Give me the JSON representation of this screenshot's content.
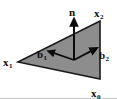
{
  "figure": {
    "kind": "geometry-diagram",
    "width": 117,
    "height": 99,
    "background_color": "#ffffff",
    "frame": {
      "visible": true,
      "color": "#c8c8c8",
      "edges": "bottom"
    }
  },
  "triangle": {
    "name": "triangle-facet",
    "fill_color": "#8d8d8d",
    "stroke_color": "#1a1a1a",
    "stroke_width": 1.6,
    "vertices": [
      {
        "label_key": "x1",
        "x": 18,
        "y": 62
      },
      {
        "label_key": "x2",
        "x": 100,
        "y": 21
      },
      {
        "label_key": "x0",
        "x": 100,
        "y": 79
      }
    ]
  },
  "origin": {
    "x": 74,
    "y": 60
  },
  "vectors": [
    {
      "key": "n",
      "label_base": "n",
      "label_sub": "",
      "color": "#0b0b0b",
      "from": {
        "x": 74,
        "y": 60
      },
      "to": {
        "x": 74,
        "y": 19
      },
      "direction": "up"
    },
    {
      "key": "b1",
      "label_base": "b",
      "label_sub": "1",
      "color": "#0b0b0b",
      "from": {
        "x": 74,
        "y": 60
      },
      "to": {
        "x": 48,
        "y": 51
      },
      "direction": "left"
    },
    {
      "key": "b2",
      "label_base": "b",
      "label_sub": "2",
      "color": "#0b0b0b",
      "from": {
        "x": 74,
        "y": 60
      },
      "to": {
        "x": 97,
        "y": 48
      },
      "direction": "right"
    }
  ],
  "labels": {
    "x1": {
      "base": "x",
      "sub": "1"
    },
    "x2": {
      "base": "x",
      "sub": "2"
    },
    "x0": {
      "base": "x",
      "sub": "0"
    },
    "n": {
      "base": "n",
      "sub": ""
    },
    "b1": {
      "base": "b",
      "sub": "1"
    },
    "b2": {
      "base": "b",
      "sub": "2"
    }
  }
}
